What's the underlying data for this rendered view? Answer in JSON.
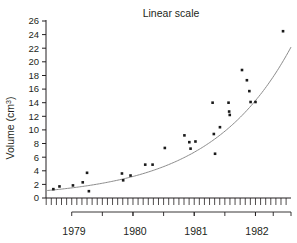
{
  "chart_data": {
    "type": "scatter",
    "title": "Linear scale",
    "xlabel": "",
    "ylabel": "Volume (cm3)",
    "ylabel_base": "Volume (cm",
    "ylabel_sup": "3",
    "ylabel_tail": ")",
    "ylim": [
      0,
      26
    ],
    "ytick_step": 2,
    "yticks": [
      0,
      2,
      4,
      6,
      8,
      10,
      12,
      14,
      16,
      18,
      20,
      22,
      24,
      26
    ],
    "xlim": [
      1978.58,
      1982.58
    ],
    "xtick_minor_interval_months": 1,
    "year_brackets": [
      "1979",
      "1980",
      "1981",
      "1982"
    ],
    "grid": false,
    "legend": null,
    "marker": {
      "shape": "square",
      "color": "#1a1a1a",
      "size": 2.6
    },
    "fit_curve": {
      "present": true,
      "type": "exponential",
      "color": "#8c8c8c",
      "a": 1.23,
      "b": 0.755,
      "t0": 1978.75
    },
    "points": [
      {
        "x": 1978.7,
        "y": 1.3
      },
      {
        "x": 1978.8,
        "y": 1.7
      },
      {
        "x": 1979.02,
        "y": 1.85
      },
      {
        "x": 1979.18,
        "y": 2.3
      },
      {
        "x": 1979.25,
        "y": 3.7
      },
      {
        "x": 1979.28,
        "y": 1.0
      },
      {
        "x": 1979.82,
        "y": 3.6
      },
      {
        "x": 1979.84,
        "y": 2.6
      },
      {
        "x": 1979.96,
        "y": 3.3
      },
      {
        "x": 1980.2,
        "y": 4.9
      },
      {
        "x": 1980.32,
        "y": 4.9
      },
      {
        "x": 1980.52,
        "y": 7.35
      },
      {
        "x": 1980.84,
        "y": 9.2
      },
      {
        "x": 1980.92,
        "y": 8.2
      },
      {
        "x": 1980.94,
        "y": 7.25
      },
      {
        "x": 1981.02,
        "y": 8.3
      },
      {
        "x": 1981.3,
        "y": 14.0
      },
      {
        "x": 1981.32,
        "y": 9.4
      },
      {
        "x": 1981.34,
        "y": 6.5
      },
      {
        "x": 1981.42,
        "y": 10.4
      },
      {
        "x": 1981.56,
        "y": 14.0
      },
      {
        "x": 1981.57,
        "y": 12.7
      },
      {
        "x": 1981.58,
        "y": 12.2
      },
      {
        "x": 1981.78,
        "y": 18.8
      },
      {
        "x": 1981.86,
        "y": 17.3
      },
      {
        "x": 1981.9,
        "y": 15.7
      },
      {
        "x": 1981.92,
        "y": 14.1
      },
      {
        "x": 1982.0,
        "y": 14.1
      },
      {
        "x": 1982.45,
        "y": 24.5
      }
    ]
  },
  "axes": {
    "y_axis_name": "volume-axis",
    "x_axis_name": "time-axis"
  }
}
